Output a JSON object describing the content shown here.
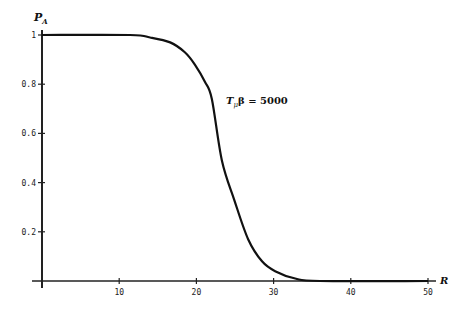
{
  "chart_data": {
    "type": "line",
    "title": "",
    "xlabel": "R",
    "ylabel": "P_A",
    "xlim": [
      0,
      50
    ],
    "ylim": [
      0,
      1
    ],
    "xticks": [
      10,
      20,
      30,
      40,
      50
    ],
    "yticks": [
      0.2,
      0.4,
      0.6,
      0.8,
      1
    ],
    "ytick_labels": [
      "0.2",
      "0.4",
      "0.6",
      "0.8",
      "1"
    ],
    "xtick_labels": [
      "10",
      "20",
      "30",
      "40",
      "50"
    ],
    "grid": false,
    "legend": null,
    "annotations": [
      {
        "text": "T_μβ = 5000",
        "x": 24,
        "y": 0.73
      }
    ],
    "series": [
      {
        "name": "T_μβ = 5000",
        "x": [
          0,
          11.4,
          14,
          16.6,
          18.5,
          19.8,
          21.1,
          22,
          23.3,
          24.9,
          26.7,
          28.5,
          30.2,
          32.8,
          36,
          50
        ],
        "y": [
          1.0,
          1.0,
          0.99,
          0.97,
          0.93,
          0.88,
          0.81,
          0.74,
          0.49,
          0.33,
          0.17,
          0.08,
          0.04,
          0.01,
          0.0,
          0.0
        ]
      }
    ]
  },
  "labels": {
    "y_axis": "P",
    "y_axis_sub": "A",
    "x_axis": "R",
    "annotation_main": "T",
    "annotation_sub": "μ",
    "annotation_rest": "β = 5000"
  }
}
